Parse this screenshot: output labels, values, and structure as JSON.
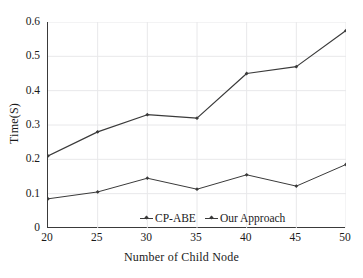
{
  "chart_data": {
    "type": "line",
    "title": "",
    "xlabel": "Number of  Child Node",
    "ylabel": "Time(S)",
    "x": [
      20,
      25,
      30,
      35,
      40,
      45,
      50
    ],
    "xtick_labels": [
      "20",
      "25",
      "30",
      "35",
      "40",
      "45",
      "50"
    ],
    "ytick_labels": [
      "0",
      "0.1",
      "0.2",
      "0.3",
      "0.4",
      "0.5",
      "0.6"
    ],
    "yticks": [
      0,
      0.1,
      0.2,
      0.3,
      0.4,
      0.5,
      0.6
    ],
    "xlim": [
      20,
      50
    ],
    "ylim": [
      0,
      0.6
    ],
    "grid": true,
    "grid_color": "#e8e8ea",
    "legend_position": "inside-bottom-center",
    "line_color": "#3a3a3a",
    "marker": "diamond",
    "series": [
      {
        "name": "CP-ABE",
        "values": [
          0.085,
          0.105,
          0.145,
          0.113,
          0.155,
          0.122,
          0.185
        ]
      },
      {
        "name": "Our Approach",
        "values": [
          0.21,
          0.28,
          0.33,
          0.32,
          0.45,
          0.47,
          0.575
        ]
      }
    ]
  },
  "legend": {
    "items": [
      {
        "label": "CP-ABE"
      },
      {
        "label": "Our Approach"
      }
    ]
  }
}
